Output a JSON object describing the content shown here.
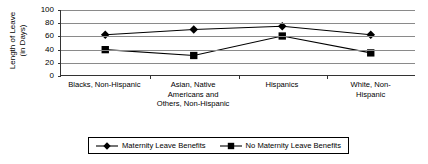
{
  "chart_data": {
    "type": "line",
    "title": "",
    "xlabel": "",
    "ylabel": "Length of Leave (in Days)",
    "ylabel_line1": "Length of Leave",
    "ylabel_line2": "(in Days)",
    "ylim": [
      0,
      100
    ],
    "yticks": [
      100,
      80,
      60,
      40,
      20,
      0
    ],
    "grid": true,
    "legend_position": "bottom-center",
    "categories": [
      "Blacks, Non-Hispanic",
      "Asian, Native Americans and Others, Non-Hispanic",
      "Hispanics",
      "White, Non-Hispanic"
    ],
    "category_lines": [
      [
        "Blacks, Non-Hispanic"
      ],
      [
        "Asian, Native",
        "Americans and",
        "Others, Non-Hispanic"
      ],
      [
        "Hispanics"
      ],
      [
        "White, Non-Hispanic"
      ]
    ],
    "series": [
      {
        "name": "Maternity Leave Benefits",
        "marker": "diamond",
        "color": "#000000",
        "values": [
          62,
          70,
          75,
          62
        ]
      },
      {
        "name": "No Maternity Leave Benefits",
        "marker": "square",
        "color": "#000000",
        "values": [
          39,
          30,
          60,
          34
        ]
      }
    ]
  },
  "legend": {
    "items": [
      {
        "label": "Maternity Leave Benefits",
        "marker": "diamond-marker-icon"
      },
      {
        "label": "No Maternity Leave Benefits",
        "marker": "square-marker-icon"
      }
    ]
  }
}
